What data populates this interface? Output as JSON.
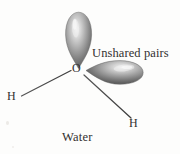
{
  "figure": {
    "background_color": "#fdfdfc",
    "caption": "Water",
    "annotation": "Unshared pairs",
    "atoms": {
      "oxygen": "O",
      "hydrogen_left": "H",
      "hydrogen_right": "H"
    },
    "lobes": {
      "vertical": {
        "name": "unshared-pair-lobe-vertical",
        "edge_color": "#6e6e6e",
        "mid_color": "#9a9a9a",
        "highlight_color": "#e8e8e8"
      },
      "horizontal": {
        "name": "unshared-pair-lobe-horizontal",
        "edge_color": "#6e6e6e",
        "mid_color": "#9a9a9a",
        "highlight_color": "#e8e8e8"
      }
    },
    "bonds": {
      "left_bond": "O-H bond left",
      "right_bond": "O-H bond right",
      "color": "#4a4a4a"
    }
  }
}
